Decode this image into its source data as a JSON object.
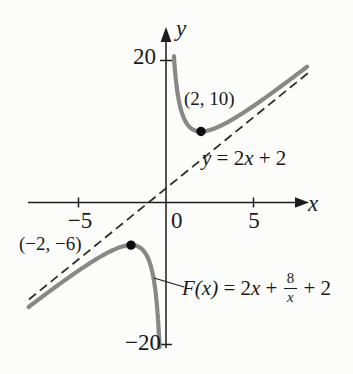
{
  "figure": {
    "background": "#fcfcfa"
  },
  "labels": {
    "y_axis": "y",
    "x_axis": "x",
    "y_tick_top": "20",
    "y_tick_bottom": "−20",
    "origin": "0",
    "x_tick_left": "−5",
    "x_tick_right": "5",
    "point_min": "(2, 10)",
    "point_max": "(−2, −6)",
    "asymptote": {
      "head": "y",
      "mid": " = 2",
      "var": "x",
      "tail": " + 2"
    },
    "function": {
      "head": "F(x)",
      "mid": " = 2",
      "var": "x",
      "plus": " + ",
      "frac_num": "8",
      "frac_den": "x",
      "tail": " + 2"
    }
  },
  "chart_data": {
    "type": "line",
    "title": "",
    "function": {
      "expression": "F(x) = 2x + 8/x + 2",
      "linear_coef": 2,
      "constant": 2,
      "reciprocal_coef": 8
    },
    "oblique_asymptote": {
      "expression": "y = 2x + 2",
      "slope": 2,
      "intercept": 2
    },
    "marked_points": [
      {
        "x": 2,
        "y": 10,
        "label": "(2, 10)",
        "type": "local minimum"
      },
      {
        "x": -2,
        "y": -6,
        "label": "(−2, −6)",
        "type": "local maximum"
      }
    ],
    "axes": {
      "x_label": "x",
      "y_label": "y",
      "x_ticks": [
        -5,
        5
      ],
      "y_ticks": [
        20,
        -20
      ],
      "x_visible_range": [
        -7.9,
        8.6
      ],
      "y_visible_range": [
        -21,
        25
      ],
      "grid": false
    },
    "branches": [
      {
        "u_min": -7.85,
        "u_max": -0.37
      },
      {
        "u_min": 0.452,
        "u_max": 8.06
      }
    ],
    "asymptote_u_range": [
      -7.83,
      8.2
    ],
    "calibration": {
      "origin_px": [
        166,
        202.5
      ],
      "px_per_unit_x": 17.5,
      "px_per_unit_y": 7.1
    },
    "style": {
      "curve_color": "#888888",
      "asymptote_color": "#2e2e2e",
      "axis_color": "#1c1c1c",
      "point_color": "#0d0d0d",
      "point_radius": 4.7,
      "text_color": "#1a1a1a"
    }
  }
}
